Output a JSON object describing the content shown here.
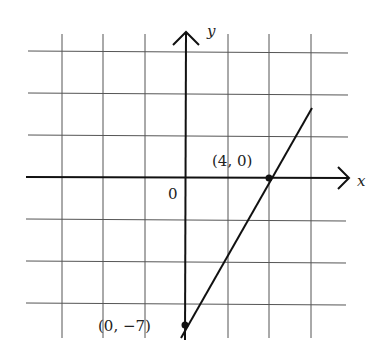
{
  "diagram": {
    "type": "coordinate-graph",
    "axes": {
      "x_label": "x",
      "y_label": "y",
      "origin_label": "0"
    },
    "points": [
      {
        "label": "(4, 0)",
        "x": 4,
        "y": 0
      },
      {
        "label": "(0, −7)",
        "x": 0,
        "y": -7
      }
    ],
    "line": {
      "description": "line through (0, -7) and (4, 0)"
    },
    "grid": {
      "x_lines": [
        -3,
        -2,
        -1,
        1,
        2,
        3
      ],
      "y_lines": [
        -3,
        -2,
        -1,
        1,
        2,
        3
      ]
    }
  }
}
